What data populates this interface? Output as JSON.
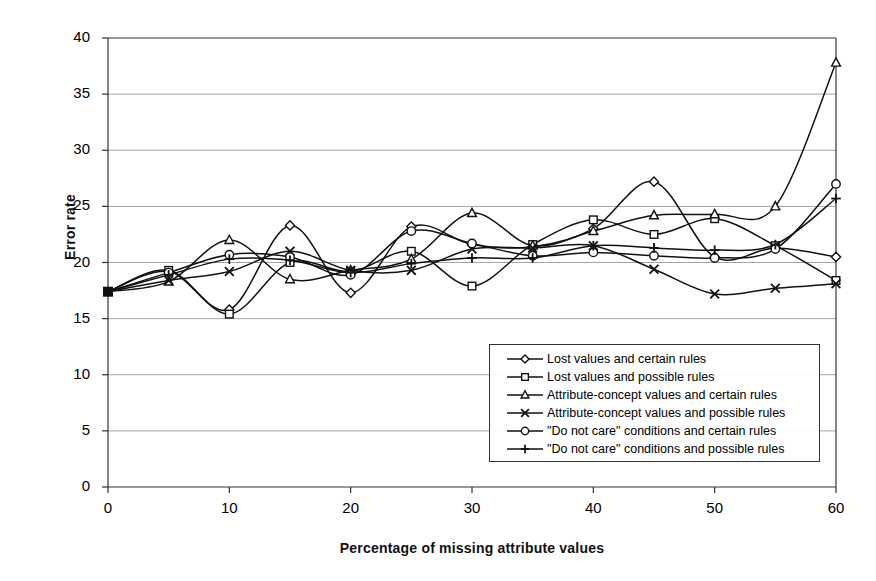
{
  "chart_data": {
    "type": "line",
    "title": "",
    "xlabel": "Percentage of missing attribute values",
    "ylabel": "Error rate",
    "xlim": [
      0,
      60
    ],
    "ylim": [
      0,
      40
    ],
    "xticks": [
      0,
      10,
      20,
      30,
      40,
      50,
      60
    ],
    "yticks": [
      0,
      5,
      10,
      15,
      20,
      25,
      30,
      35,
      40
    ],
    "grid": "horizontal",
    "legend_position": "inside-lower-right",
    "x": [
      0,
      5,
      10,
      15,
      20,
      25,
      30,
      35,
      40,
      45,
      50,
      55,
      60
    ],
    "series": [
      {
        "name": "Lost values and certain rules",
        "marker": "diamond",
        "values": [
          17.4,
          19.2,
          15.8,
          23.3,
          17.3,
          23.2,
          21.6,
          21.4,
          23.0,
          27.2,
          20.5,
          21.3,
          20.5
        ]
      },
      {
        "name": "Lost values and possible rules",
        "marker": "square",
        "values": [
          17.4,
          19.3,
          15.4,
          20.0,
          19.2,
          21.0,
          17.9,
          21.6,
          23.8,
          22.5,
          23.9,
          21.5,
          18.4
        ]
      },
      {
        "name": "Attribute-concept values and certain rules",
        "marker": "triangle",
        "values": [
          17.4,
          18.3,
          22.0,
          18.5,
          19.3,
          20.3,
          24.4,
          21.5,
          22.8,
          24.2,
          24.3,
          25.0,
          37.8
        ]
      },
      {
        "name": "Attribute-concept values and possible rules",
        "marker": "x",
        "values": [
          17.4,
          18.4,
          19.2,
          21.0,
          19.3,
          19.3,
          21.2,
          21.3,
          21.5,
          19.4,
          17.2,
          17.7,
          18.1
        ]
      },
      {
        "name": "\"Do not care\" conditions and certain rules",
        "marker": "circle",
        "values": [
          17.4,
          19.1,
          20.7,
          20.5,
          18.9,
          22.8,
          21.7,
          20.6,
          20.9,
          20.6,
          20.4,
          21.2,
          27.0
        ]
      },
      {
        "name": "\"Do not care\" conditions and possible rules",
        "marker": "plus",
        "values": [
          17.4,
          18.9,
          20.3,
          20.2,
          19.1,
          19.9,
          20.4,
          20.4,
          21.5,
          21.3,
          21.1,
          21.6,
          25.7
        ]
      }
    ]
  },
  "colors": {
    "line": "#111111",
    "grid": "#9a9a9a",
    "axis": "#333333",
    "background": "#ffffff"
  }
}
